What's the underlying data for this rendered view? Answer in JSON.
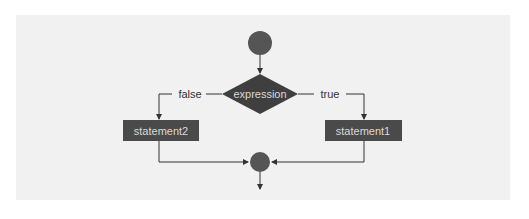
{
  "diagram": {
    "type": "flowchart",
    "nodes": {
      "start": {
        "shape": "circle",
        "label": ""
      },
      "decision": {
        "shape": "diamond",
        "label": "expression"
      },
      "statement1": {
        "shape": "rectangle",
        "label": "statement1"
      },
      "statement2": {
        "shape": "rectangle",
        "label": "statement2"
      },
      "merge": {
        "shape": "circle",
        "label": ""
      }
    },
    "edges": {
      "false_label": "false",
      "true_label": "true"
    },
    "colors": {
      "panel_bg": "#f1f1f1",
      "node_fill": "#4a4a4a",
      "node_text": "#d8d8d8",
      "line": "#333333"
    }
  }
}
